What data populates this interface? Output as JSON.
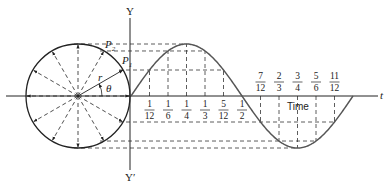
{
  "diagram": {
    "labels": {
      "y_axis_top": "Y",
      "y_axis_bottom": "Y′",
      "t_axis": "t",
      "time": "Time",
      "radius": "r",
      "angle": "θ",
      "p1": "P",
      "p1_sub": "1",
      "p2": "P",
      "p2_sub": "2"
    },
    "fractions_below_axis": [
      {
        "num": "1",
        "den": "12"
      },
      {
        "num": "1",
        "den": "6"
      },
      {
        "num": "1",
        "den": "4"
      },
      {
        "num": "1",
        "den": "3"
      },
      {
        "num": "5",
        "den": "12"
      },
      {
        "num": "1",
        "den": "2"
      }
    ],
    "fractions_above_axis": [
      {
        "num": "7",
        "den": "12"
      },
      {
        "num": "2",
        "den": "3"
      },
      {
        "num": "3",
        "den": "4"
      },
      {
        "num": "5",
        "den": "6"
      },
      {
        "num": "11",
        "den": "12"
      }
    ],
    "colors": {
      "ink": "#222222",
      "curve": "#555555",
      "background": "#ffffff"
    },
    "geometry": {
      "circle_center": [
        78,
        96
      ],
      "radius": 52,
      "y_axis_x": 130,
      "t_axis_y": 96,
      "wave_start_x": 131,
      "period_px": 222,
      "amplitude_px": 52,
      "radial_divisions": 12
    }
  }
}
